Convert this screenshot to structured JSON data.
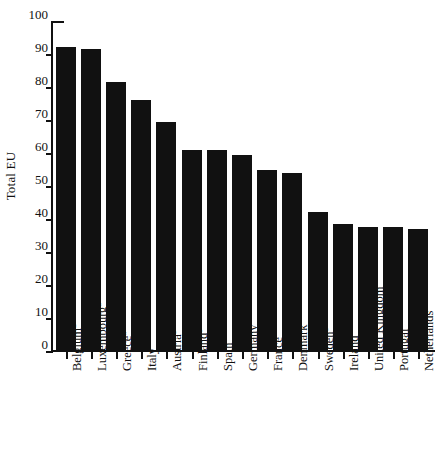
{
  "chart_data": {
    "type": "bar",
    "title": "",
    "xlabel": "",
    "ylabel": "Total EU",
    "ylim": [
      0,
      100
    ],
    "ytick_step": 10,
    "yticks": [
      "100",
      "90",
      "80",
      "70",
      "60",
      "50",
      "40",
      "30",
      "20",
      "10",
      "0"
    ],
    "grid": false,
    "legend": "none",
    "bar_color": "#111111",
    "categories": [
      "Belgium",
      "Luxembourg",
      "Greece",
      "Italy",
      "Austria",
      "Finland",
      "Spain",
      "Germany",
      "France",
      "Denmark",
      "Sweden",
      "Ireland",
      "United Kingdom",
      "Portugal",
      "Netherlands"
    ],
    "category_footnotes": [
      "a",
      "a",
      "a",
      "",
      "b",
      "b",
      "",
      "",
      "",
      "",
      "b",
      "",
      "",
      "",
      ""
    ],
    "values": [
      92,
      91.5,
      81.5,
      76,
      69.5,
      61,
      61,
      59.5,
      55,
      54,
      42,
      38.5,
      37.5,
      37.5,
      37
    ]
  }
}
